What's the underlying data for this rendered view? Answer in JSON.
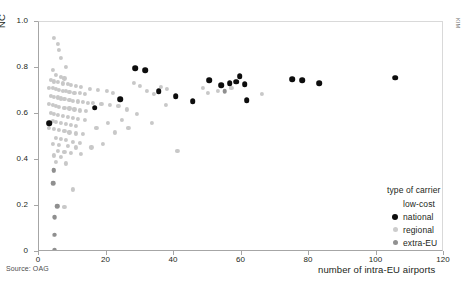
{
  "figure": {
    "source_note": "Source: OAG",
    "edge_text": "KIM",
    "top_strip_text": ""
  },
  "legend": {
    "title": "type of carrier",
    "entries": [
      {
        "label": "low-cost",
        "marker": "lowcost",
        "color": "#ffffff"
      },
      {
        "label": "national",
        "marker": "national",
        "color": "#0d0d0d"
      },
      {
        "label": "regional",
        "marker": "regional",
        "color": "#cccccc"
      },
      {
        "label": "extra-EU",
        "marker": "extraeu",
        "color": "#919191"
      }
    ]
  },
  "chart_data": {
    "type": "scatter",
    "title": "",
    "xlabel": "number of intra-EU airports",
    "ylabel": "NC",
    "xlim": [
      0,
      120
    ],
    "ylim": [
      0,
      1.0
    ],
    "xticks": [
      0,
      20,
      40,
      60,
      80,
      100,
      120
    ],
    "xticklabels": [
      "0",
      "20",
      "40",
      "60",
      "80",
      "100",
      "120"
    ],
    "yticks": [
      0,
      0.2,
      0.4,
      0.6,
      0.8,
      1.0
    ],
    "yticklabels": [
      "0",
      "0.2",
      "0.4",
      "0.6",
      "0.8",
      "1.0"
    ],
    "grid": false,
    "legend_position": "inside-lower-right",
    "series": [
      {
        "name": "national",
        "color": "#0d0d0d",
        "points": [
          [
            16.5,
            0.627
          ],
          [
            24.0,
            0.665
          ],
          [
            28.5,
            0.8
          ],
          [
            31.5,
            0.79
          ],
          [
            35.5,
            0.7
          ],
          [
            40.5,
            0.677
          ],
          [
            45.5,
            0.655
          ],
          [
            50.5,
            0.748
          ],
          [
            54.0,
            0.724
          ],
          [
            56.5,
            0.734
          ],
          [
            58.5,
            0.74
          ],
          [
            59.5,
            0.765
          ],
          [
            61.0,
            0.73
          ],
          [
            61.5,
            0.66
          ],
          [
            75.0,
            0.752
          ],
          [
            78.0,
            0.748
          ],
          [
            83.0,
            0.735
          ],
          [
            105.5,
            0.757
          ],
          [
            3.0,
            0.56
          ]
        ]
      },
      {
        "name": "regional",
        "color": "#cccccc",
        "points": [
          [
            4.5,
            0.93
          ],
          [
            5.5,
            0.905
          ],
          [
            6.0,
            0.88
          ],
          [
            6.5,
            0.845
          ],
          [
            8.0,
            0.805
          ],
          [
            4.0,
            0.79
          ],
          [
            5.0,
            0.77
          ],
          [
            6.5,
            0.762
          ],
          [
            7.5,
            0.755
          ],
          [
            3.5,
            0.748
          ],
          [
            4.5,
            0.742
          ],
          [
            5.5,
            0.738
          ],
          [
            7.0,
            0.733
          ],
          [
            8.5,
            0.73
          ],
          [
            9.5,
            0.726
          ],
          [
            11.0,
            0.722
          ],
          [
            12.5,
            0.718
          ],
          [
            3.0,
            0.715
          ],
          [
            4.0,
            0.712
          ],
          [
            5.0,
            0.708
          ],
          [
            6.0,
            0.705
          ],
          [
            7.0,
            0.702
          ],
          [
            8.0,
            0.699
          ],
          [
            9.0,
            0.696
          ],
          [
            10.5,
            0.693
          ],
          [
            12.0,
            0.69
          ],
          [
            13.5,
            0.687
          ],
          [
            15.0,
            0.71
          ],
          [
            17.5,
            0.705
          ],
          [
            20.0,
            0.7
          ],
          [
            22.0,
            0.69
          ],
          [
            3.5,
            0.68
          ],
          [
            4.5,
            0.676
          ],
          [
            5.5,
            0.672
          ],
          [
            6.5,
            0.668
          ],
          [
            7.5,
            0.665
          ],
          [
            9.0,
            0.662
          ],
          [
            10.0,
            0.658
          ],
          [
            11.5,
            0.655
          ],
          [
            13.0,
            0.652
          ],
          [
            14.5,
            0.648
          ],
          [
            3.0,
            0.645
          ],
          [
            4.0,
            0.64
          ],
          [
            5.0,
            0.636
          ],
          [
            6.0,
            0.632
          ],
          [
            7.5,
            0.628
          ],
          [
            9.0,
            0.624
          ],
          [
            10.5,
            0.62
          ],
          [
            12.0,
            0.616
          ],
          [
            14.0,
            0.612
          ],
          [
            16.0,
            0.65
          ],
          [
            18.5,
            0.645
          ],
          [
            21.0,
            0.64
          ],
          [
            23.5,
            0.635
          ],
          [
            3.5,
            0.605
          ],
          [
            4.5,
            0.6
          ],
          [
            5.5,
            0.596
          ],
          [
            7.0,
            0.592
          ],
          [
            8.5,
            0.588
          ],
          [
            10.0,
            0.584
          ],
          [
            11.5,
            0.58
          ],
          [
            13.5,
            0.576
          ],
          [
            4.0,
            0.57
          ],
          [
            5.0,
            0.565
          ],
          [
            6.5,
            0.56
          ],
          [
            8.0,
            0.556
          ],
          [
            9.5,
            0.552
          ],
          [
            11.0,
            0.548
          ],
          [
            3.0,
            0.54
          ],
          [
            4.5,
            0.535
          ],
          [
            6.0,
            0.53
          ],
          [
            7.5,
            0.525
          ],
          [
            9.0,
            0.52
          ],
          [
            11.0,
            0.516
          ],
          [
            13.0,
            0.512
          ],
          [
            5.0,
            0.495
          ],
          [
            6.5,
            0.49
          ],
          [
            8.0,
            0.486
          ],
          [
            10.0,
            0.48
          ],
          [
            12.0,
            0.476
          ],
          [
            4.0,
            0.47
          ],
          [
            6.0,
            0.465
          ],
          [
            8.5,
            0.46
          ],
          [
            11.0,
            0.455
          ],
          [
            5.5,
            0.44
          ],
          [
            7.5,
            0.435
          ],
          [
            9.5,
            0.43
          ],
          [
            12.5,
            0.425
          ],
          [
            4.5,
            0.42
          ],
          [
            6.5,
            0.415
          ],
          [
            5.0,
            0.39
          ],
          [
            8.0,
            0.385
          ],
          [
            4.5,
            0.355
          ],
          [
            4.0,
            0.3
          ],
          [
            10.0,
            0.272
          ],
          [
            5.5,
            0.2
          ],
          [
            7.5,
            0.195
          ],
          [
            4.5,
            0.152
          ],
          [
            4.5,
            0.075
          ],
          [
            4.5,
            0.01
          ],
          [
            28.0,
            0.735
          ],
          [
            30.0,
            0.722
          ],
          [
            32.0,
            0.7
          ],
          [
            34.0,
            0.688
          ],
          [
            26.0,
            0.62
          ],
          [
            29.0,
            0.6
          ],
          [
            36.0,
            0.718
          ],
          [
            38.0,
            0.708
          ],
          [
            37.5,
            0.64
          ],
          [
            41.0,
            0.44
          ],
          [
            33.5,
            0.56
          ],
          [
            24.5,
            0.575
          ],
          [
            20.5,
            0.56
          ],
          [
            17.0,
            0.54
          ],
          [
            50.0,
            0.69
          ],
          [
            53.0,
            0.7
          ],
          [
            48.5,
            0.712
          ],
          [
            57.0,
            0.715
          ],
          [
            66.0,
            0.688
          ],
          [
            22.5,
            0.52
          ],
          [
            19.0,
            0.47
          ],
          [
            15.5,
            0.455
          ],
          [
            26.5,
            0.54
          ]
        ]
      },
      {
        "name": "extra-EU",
        "color": "#919191",
        "points": [
          [
            3.0,
            0.56
          ],
          [
            4.2,
            0.3
          ],
          [
            4.6,
            0.152
          ],
          [
            4.6,
            0.075
          ],
          [
            4.6,
            0.01
          ],
          [
            5.4,
            0.2
          ],
          [
            4.4,
            0.355
          ],
          [
            55.0,
            0.7
          ]
        ]
      },
      {
        "name": "low-cost",
        "color": "#ffffff",
        "points": []
      }
    ]
  }
}
